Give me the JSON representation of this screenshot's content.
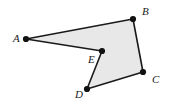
{
  "figure": {
    "name": "polygon-abcde",
    "type": "geometry-diagram",
    "canvas": {
      "width": 173,
      "height": 104
    },
    "background_color": "#ffffff",
    "fill_color": "#e8e8e8",
    "stroke_color": "#1a1a1a",
    "stroke_width": 1.6,
    "vertex_dot_color": "#111111",
    "vertex_dot_radius": 3.1,
    "label_color": "#1a1a1a",
    "shape": "concave pentagon",
    "vertex_order": [
      "A",
      "B",
      "C",
      "D",
      "E"
    ],
    "vertices": [
      {
        "id": "A",
        "label": "A",
        "x": 26,
        "y": 39,
        "label_x": 13,
        "label_y": 33
      },
      {
        "id": "B",
        "label": "B",
        "x": 133,
        "y": 19,
        "label_x": 142,
        "label_y": 6
      },
      {
        "id": "C",
        "label": "C",
        "x": 143,
        "y": 72,
        "label_x": 152,
        "label_y": 74
      },
      {
        "id": "D",
        "label": "D",
        "x": 87,
        "y": 89,
        "label_x": 75,
        "label_y": 89
      },
      {
        "id": "E",
        "label": "E",
        "x": 102,
        "y": 51,
        "label_x": 88,
        "label_y": 54
      }
    ],
    "edges": [
      {
        "from": "A",
        "to": "B"
      },
      {
        "from": "B",
        "to": "C"
      },
      {
        "from": "C",
        "to": "D"
      },
      {
        "from": "D",
        "to": "E"
      },
      {
        "from": "E",
        "to": "A"
      }
    ]
  }
}
